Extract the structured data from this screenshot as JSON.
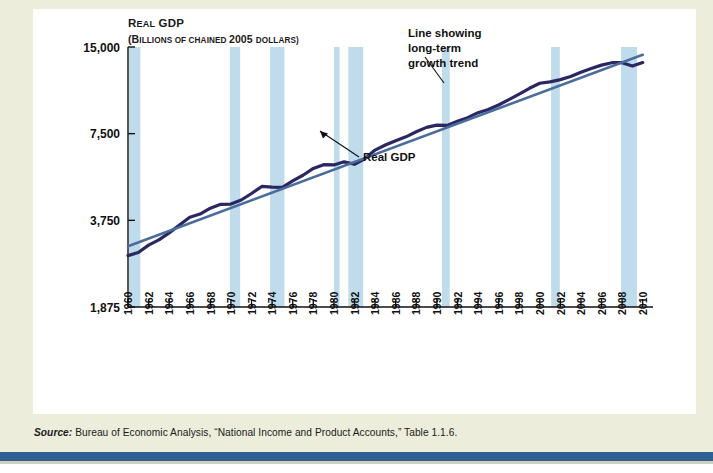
{
  "figure": {
    "background_color": "#eceddb",
    "plate_color": "#ffffff",
    "rule_color": "#2f5f94"
  },
  "source": {
    "lead": "Source:",
    "text": " Bureau of Economic Analysis, “National Income and Product Accounts,” Table 1.1.6."
  },
  "chart_data": {
    "type": "line",
    "title": "",
    "ylabel_line1": "Real GDP",
    "ylabel_line1_caps": "R",
    "ylabel_line1_rest": "EAL",
    "ylabel_line1_word2_caps": "GDP",
    "ylabel_line2": "(Billions of chained 2005 dollars)",
    "ylabel_line2_parts": [
      {
        "text": "(B",
        "size": "lg"
      },
      {
        "text": "ILLIONS OF CHAINED ",
        "size": "sm"
      },
      {
        "text": "2005 ",
        "size": "lg"
      },
      {
        "text": "DOLLARS)",
        "size": "sm"
      }
    ],
    "xlabel": "",
    "yscale": "log",
    "ylim": [
      1875,
      15000
    ],
    "yticks": [
      1875,
      3750,
      7500,
      15000
    ],
    "ytick_labels": [
      "1,875",
      "3,750",
      "7,500",
      "15,000"
    ],
    "xlim": [
      1960,
      2011
    ],
    "xticks": [
      1960,
      1962,
      1964,
      1966,
      1968,
      1970,
      1972,
      1974,
      1976,
      1978,
      1980,
      1982,
      1984,
      1986,
      1988,
      1990,
      1992,
      1994,
      1996,
      1998,
      2000,
      2002,
      2004,
      2006,
      2008,
      2010
    ],
    "xtick_labels": [
      "1960",
      "1962",
      "1964",
      "1966",
      "1968",
      "1970",
      "1972",
      "1974",
      "1976",
      "1978",
      "1980",
      "1982",
      "1984",
      "1986",
      "1988",
      "1990",
      "1992",
      "1994",
      "1996",
      "1998",
      "2000",
      "2002",
      "2004",
      "2006",
      "2008",
      "2010"
    ],
    "grid": false,
    "legend_position": "none",
    "series": [
      {
        "name": "Real GDP",
        "color": "#2b2763",
        "width": 3.2,
        "x": [
          1960,
          1961,
          1962,
          1963,
          1964,
          1965,
          1966,
          1967,
          1968,
          1969,
          1970,
          1971,
          1972,
          1973,
          1974,
          1975,
          1976,
          1977,
          1978,
          1979,
          1980,
          1981,
          1982,
          1983,
          1984,
          1985,
          1986,
          1987,
          1988,
          1989,
          1990,
          1991,
          1992,
          1993,
          1994,
          1995,
          1996,
          1997,
          1998,
          1999,
          2000,
          2001,
          2002,
          2003,
          2004,
          2005,
          2006,
          2007,
          2008,
          2009,
          2010
        ],
        "y": [
          2828,
          2899,
          3075,
          3207,
          3392,
          3610,
          3845,
          3943,
          4133,
          4262,
          4270,
          4413,
          4648,
          4917,
          4890,
          4880,
          5142,
          5378,
          5678,
          5855,
          5839,
          5987,
          5871,
          6137,
          6577,
          6849,
          7087,
          7313,
          7614,
          7886,
          8034,
          8015,
          8287,
          8524,
          8871,
          9094,
          9434,
          9854,
          10284,
          10780,
          11226,
          11347,
          11553,
          11841,
          12264,
          12638,
          12976,
          13229,
          13229,
          12880,
          13248
        ]
      },
      {
        "name": "Line showing long-term growth trend",
        "color": "#4a6d9c",
        "width": 2.6,
        "x": [
          1960,
          2010
        ],
        "y": [
          3050,
          14100
        ]
      }
    ],
    "recession_bands": {
      "color": "#bedcec",
      "ranges": [
        [
          1960.1,
          1961.2
        ],
        [
          1969.9,
          1970.9
        ],
        [
          1973.8,
          1975.2
        ],
        [
          1980.0,
          1980.55
        ],
        [
          1981.4,
          1982.85
        ],
        [
          1990.5,
          1991.25
        ],
        [
          2001.1,
          2001.95
        ],
        [
          2007.9,
          2009.45
        ]
      ]
    },
    "annotations": [
      {
        "id": "trend-annotation",
        "lines": [
          "Line showing",
          "long-term",
          "growth trend"
        ],
        "text": "Line showing long-term growth trend",
        "text_x": 375,
        "text_y": 28,
        "leader": {
          "x1": 392,
          "y1": 48,
          "x2": 411,
          "y2": 74
        }
      },
      {
        "id": "real-gdp-annotation",
        "lines": [
          "Real GDP"
        ],
        "text": "Real GDP",
        "text_x": 330,
        "text_y": 152,
        "leader": {
          "x1": 326,
          "y1": 148,
          "x2": 287,
          "y2": 122
        }
      }
    ]
  }
}
